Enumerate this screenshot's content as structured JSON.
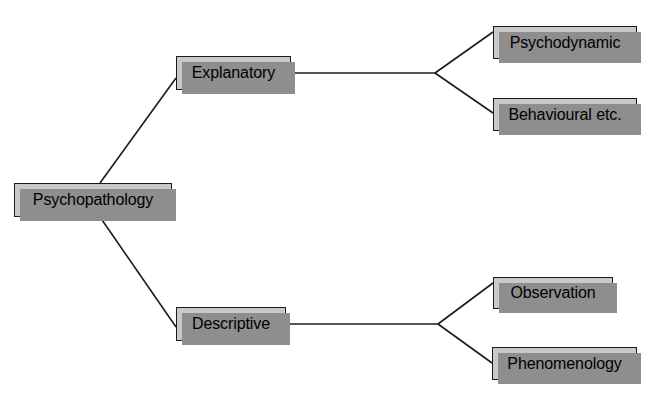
{
  "diagram": {
    "type": "tree-hierarchy",
    "background_color": "#ffffff",
    "node_fill_color": "#c9c9c9",
    "node_border_color": "#1b1b1b",
    "node_shadow_color": "#8e8e8e",
    "connector_color": "#1b1b1b",
    "nodes": [
      {
        "id": "psychopathology",
        "label": "Psychopathology",
        "level": 0,
        "x": 14,
        "y": 183,
        "w": 158,
        "h": 34
      },
      {
        "id": "explanatory",
        "label": "Explanatory",
        "level": 1,
        "x": 176,
        "y": 56,
        "w": 115,
        "h": 34
      },
      {
        "id": "descriptive",
        "label": "Descriptive",
        "level": 1,
        "x": 176,
        "y": 307,
        "w": 110,
        "h": 34
      },
      {
        "id": "psychodynamic",
        "label": "Psychodynamic",
        "level": 2,
        "x": 493,
        "y": 26,
        "w": 144,
        "h": 33
      },
      {
        "id": "behavioural",
        "label": "Behavioural etc.",
        "level": 2,
        "x": 493,
        "y": 98,
        "w": 144,
        "h": 33
      },
      {
        "id": "observation",
        "label": "Observation",
        "level": 2,
        "x": 493,
        "y": 277,
        "w": 120,
        "h": 32
      },
      {
        "id": "phenomenology",
        "label": "Phenomenology",
        "level": 2,
        "x": 492,
        "y": 347,
        "w": 145,
        "h": 33
      }
    ],
    "edges": [
      {
        "id": "edge-psychopathology-explanatory",
        "from": "psychopathology",
        "to": "explanatory",
        "x1": 100,
        "y1": 183,
        "x2": 176,
        "y2": 78
      },
      {
        "id": "edge-psychopathology-descriptive",
        "from": "psychopathology",
        "to": "descriptive",
        "x1": 100,
        "y1": 217,
        "x2": 176,
        "y2": 327
      },
      {
        "id": "edge-explanatory-trunk",
        "from": "explanatory",
        "to": "fork-upper",
        "x1": 291,
        "y1": 73,
        "x2": 435,
        "y2": 73
      },
      {
        "id": "edge-fork-psychodynamic",
        "from": "fork-upper",
        "to": "psychodynamic",
        "x1": 435,
        "y1": 73,
        "x2": 493,
        "y2": 32
      },
      {
        "id": "edge-fork-behavioural",
        "from": "fork-upper",
        "to": "behavioural",
        "x1": 435,
        "y1": 73,
        "x2": 493,
        "y2": 113
      },
      {
        "id": "edge-descriptive-trunk",
        "from": "descriptive",
        "to": "fork-lower",
        "x1": 286,
        "y1": 324,
        "x2": 438,
        "y2": 324
      },
      {
        "id": "edge-fork-observation",
        "from": "fork-lower",
        "to": "observation",
        "x1": 438,
        "y1": 324,
        "x2": 493,
        "y2": 283
      },
      {
        "id": "edge-fork-phenomenology",
        "from": "fork-lower",
        "to": "phenomenology",
        "x1": 438,
        "y1": 324,
        "x2": 492,
        "y2": 363
      }
    ]
  }
}
